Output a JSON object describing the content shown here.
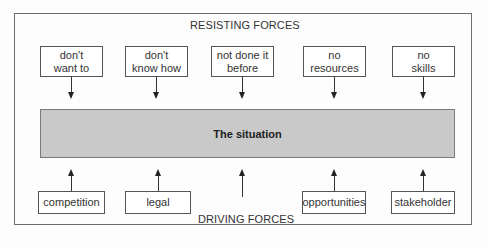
{
  "diagram": {
    "type": "force-field-analysis",
    "resisting_title": "RESISTING FORCES",
    "driving_title": "DRIVING FORCES",
    "center_label": "The situation",
    "resisting_forces": [
      {
        "label": "don't\nwant to"
      },
      {
        "label": "don't\nknow how"
      },
      {
        "label": "not done it\nbefore"
      },
      {
        "label": "no\nresources"
      },
      {
        "label": "no\nskills"
      }
    ],
    "driving_forces": [
      {
        "label": "competition"
      },
      {
        "label": "legal"
      },
      {
        "label": ""
      },
      {
        "label": "opportunities"
      },
      {
        "label": "stakeholder"
      }
    ],
    "colors": {
      "center_fill": "#c9c9c9",
      "border": "#555555",
      "arrow": "#222222"
    }
  }
}
